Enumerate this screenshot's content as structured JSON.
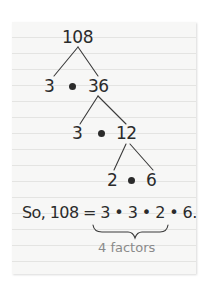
{
  "tree": {
    "root": "108",
    "level1": {
      "left": "3",
      "right": "36"
    },
    "level2": {
      "left": "3",
      "right": "12"
    },
    "level3": {
      "left": "2",
      "right": "6"
    }
  },
  "equation": {
    "prefix": "So, 108 =",
    "factors": [
      "3",
      "3",
      "2",
      "6"
    ],
    "suffix": "."
  },
  "brace_label": "4 factors",
  "colors": {
    "ink": "#2b2b2b",
    "label": "#8a8a8a",
    "paper": "#f7f7f6",
    "rule_lines": "#e4e4e2"
  }
}
